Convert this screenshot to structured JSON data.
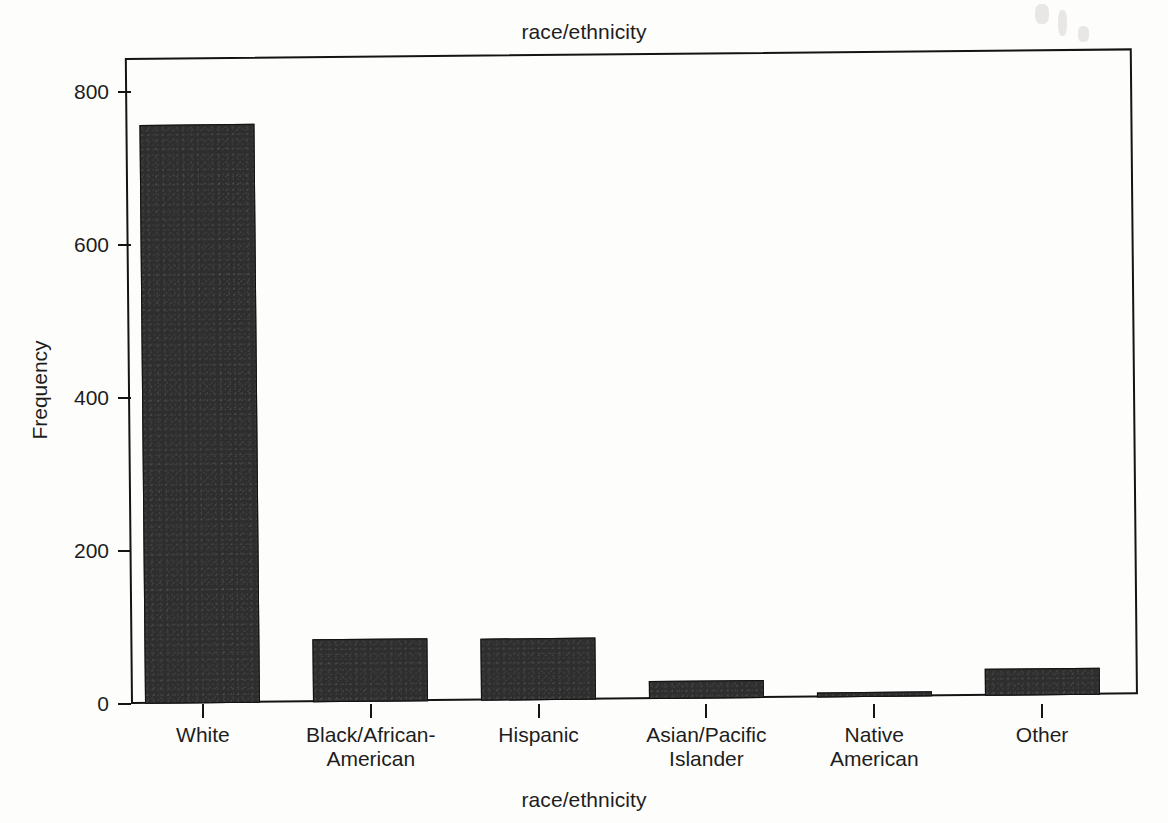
{
  "chart_data": {
    "type": "bar",
    "title": "race/ethnicity",
    "xlabel": "race/ethnicity",
    "ylabel": "Frequency",
    "categories": [
      "White",
      "Black/African-American",
      "Hispanic",
      "Asian/Pacific Islander",
      "Native American",
      "Other"
    ],
    "category_lines": [
      [
        "White"
      ],
      [
        "Black/African-",
        "American"
      ],
      [
        "Hispanic"
      ],
      [
        "Asian/Pacific",
        "Islander"
      ],
      [
        "Native",
        "American"
      ],
      [
        "Other"
      ]
    ],
    "values": [
      758,
      83,
      81,
      23,
      6,
      35
    ],
    "ylim": [
      0,
      845
    ],
    "yticks": [
      0,
      200,
      400,
      600,
      800
    ],
    "ytick_labels": [
      "0",
      "200",
      "400",
      "600",
      "800"
    ],
    "grid": false,
    "legend": false,
    "bar_color": "#2e2e2e",
    "axis_color": "#141414",
    "background_color": "#fdfdfc"
  }
}
